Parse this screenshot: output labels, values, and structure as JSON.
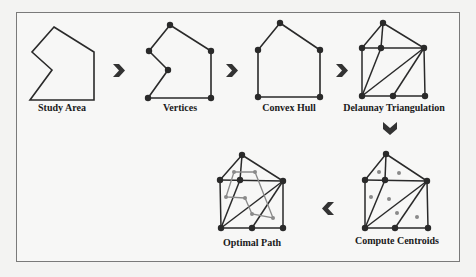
{
  "diagram": {
    "steps": [
      {
        "id": "study-area",
        "label": "Study Area"
      },
      {
        "id": "vertices",
        "label": "Vertices"
      },
      {
        "id": "convex-hull",
        "label": "Convex Hull"
      },
      {
        "id": "delaunay",
        "label": "Delaunay Triangulation"
      },
      {
        "id": "centroids",
        "label": "Compute Centroids"
      },
      {
        "id": "optimal-path",
        "label": "Optimal Path"
      }
    ],
    "arrows": [
      {
        "direction": "right",
        "from": "study-area",
        "to": "vertices"
      },
      {
        "direction": "right",
        "from": "vertices",
        "to": "convex-hull"
      },
      {
        "direction": "right",
        "from": "convex-hull",
        "to": "delaunay"
      },
      {
        "direction": "down",
        "from": "delaunay",
        "to": "centroids"
      },
      {
        "direction": "left",
        "from": "centroids",
        "to": "optimal-path"
      }
    ],
    "colors": {
      "line": "#2a2a2a",
      "vertex": "#2a2a2a",
      "centroid": "#8a8a8a",
      "path": "#8a8a8a",
      "arrow": "#333333"
    }
  }
}
